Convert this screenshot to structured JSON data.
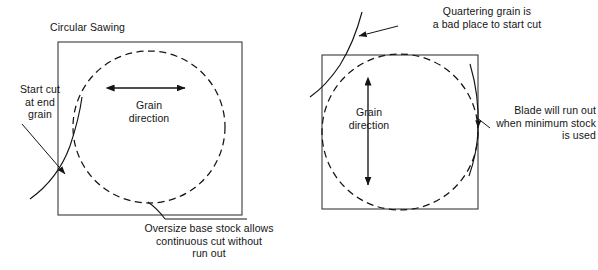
{
  "figure": {
    "title": "Circular Sawing",
    "domain": "technical-diagram",
    "ink_color": "#141414",
    "background_color": "#ffffff"
  },
  "left_panel": {
    "name": "circular-sawing-correct-orientation",
    "title": "Circular Sawing",
    "stock_shape": "square",
    "cut_shape": "dashed-circle",
    "grain_label": "Grain\ndirection",
    "grain_axis": "horizontal",
    "grain_arrow": "double-headed",
    "callouts": [
      {
        "id": "start-cut",
        "text": "Start cut\nat end\ngrain",
        "align": "center",
        "points_to": "blade entry curve at left edge of stock"
      },
      {
        "id": "oversize-base",
        "text": "Oversize base stock allows\ncontinuous cut without\nrun out",
        "align": "center",
        "points_to": "blade exit curve at bottom of stock"
      }
    ]
  },
  "right_panel": {
    "name": "circular-sawing-poor-orientation",
    "stock_shape": "square",
    "cut_shape": "dashed-circle",
    "grain_label": "Grain\ndirection",
    "grain_axis": "vertical",
    "grain_arrow": "double-headed",
    "callouts": [
      {
        "id": "quartering-grain",
        "text": "Quartering grain is\na bad place to start cut",
        "align": "center",
        "points_to": "blade entry curve at top-left of stock"
      },
      {
        "id": "blade-run-out",
        "text": "Blade will run out\nwhen minimum stock\nis used",
        "align": "right",
        "points_to": "blade exit curve at right edge of stock"
      }
    ]
  },
  "geometry": {
    "left_square": {
      "x": 58,
      "y": 42,
      "w": 184,
      "h": 173
    },
    "left_circle": {
      "cx": 149,
      "cy": 127,
      "r": 76
    },
    "left_grain_arrow": {
      "x1": 113,
      "y1": 88,
      "x2": 186,
      "y2": 88
    },
    "right_square": {
      "x": 322,
      "y": 55,
      "w": 156,
      "h": 154
    },
    "right_circle": {
      "cx": 400,
      "cy": 132,
      "r": 78
    },
    "right_grain_arrow": {
      "x1": 368,
      "y1": 84,
      "x2": 368,
      "y2": 186
    },
    "dash_pattern": "6 4",
    "stroke_width": 1
  }
}
